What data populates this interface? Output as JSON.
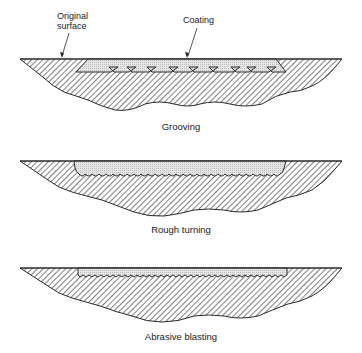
{
  "figure": {
    "panels": [
      {
        "id": "grooving",
        "caption": "Grooving",
        "callouts": [
          {
            "line1": "Original",
            "line2": "surface"
          },
          {
            "line1": "Coating"
          }
        ]
      },
      {
        "id": "rough-turning",
        "caption": "Rough turning"
      },
      {
        "id": "abrasive-blasting",
        "caption": "Abrasive blasting"
      }
    ],
    "colors": {
      "outline": "#2a2a2a",
      "hatch": "#4a4a4a",
      "coating_fill": "#d9d9d9",
      "background": "#ffffff"
    }
  }
}
